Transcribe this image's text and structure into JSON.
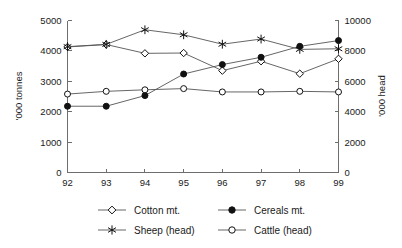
{
  "chart_data": {
    "type": "line",
    "title": "",
    "xlabel": "",
    "ylabel": "'000 tonnes",
    "y2label": "'000 head",
    "categories": [
      "92",
      "93",
      "94",
      "95",
      "96",
      "97",
      "98",
      "99"
    ],
    "ylim": [
      0,
      5000
    ],
    "y2lim": [
      0,
      10000
    ],
    "yticks": [
      "0",
      "1000",
      "2000",
      "3000",
      "4000",
      "5000"
    ],
    "ytick_values": [
      0,
      1000,
      2000,
      3000,
      4000,
      5000
    ],
    "y2ticks": [
      "0",
      "2000",
      "4000",
      "6000",
      "8000",
      "10000"
    ],
    "y2tick_values": [
      0,
      2000,
      4000,
      6000,
      8000,
      10000
    ],
    "grid": false,
    "legend_position": "bottom",
    "series": [
      {
        "name": "Cotton mt.",
        "axis": "left",
        "marker": "open-diamond",
        "values": [
          4130,
          4210,
          3920,
          3930,
          3350,
          3660,
          3250,
          3740
        ]
      },
      {
        "name": "Cereals mt.",
        "axis": "left",
        "marker": "filled-circle",
        "values": [
          2180,
          2180,
          2530,
          3240,
          3550,
          3790,
          4150,
          4340
        ]
      },
      {
        "name": "Sheep (head)",
        "axis": "right",
        "marker": "star",
        "values": [
          8280,
          8430,
          9390,
          9060,
          8440,
          8780,
          8100,
          8140
        ]
      },
      {
        "name": "Cattle (head)",
        "axis": "right",
        "marker": "open-circle",
        "values": [
          5160,
          5340,
          5440,
          5520,
          5300,
          5300,
          5340,
          5300
        ]
      }
    ]
  },
  "legend": {
    "items": [
      {
        "label": "Cotton mt.",
        "marker": "open-diamond"
      },
      {
        "label": "Cereals mt.",
        "marker": "filled-circle"
      },
      {
        "label": "Sheep (head)",
        "marker": "star"
      },
      {
        "label": "Cattle (head)",
        "marker": "open-circle"
      }
    ]
  }
}
